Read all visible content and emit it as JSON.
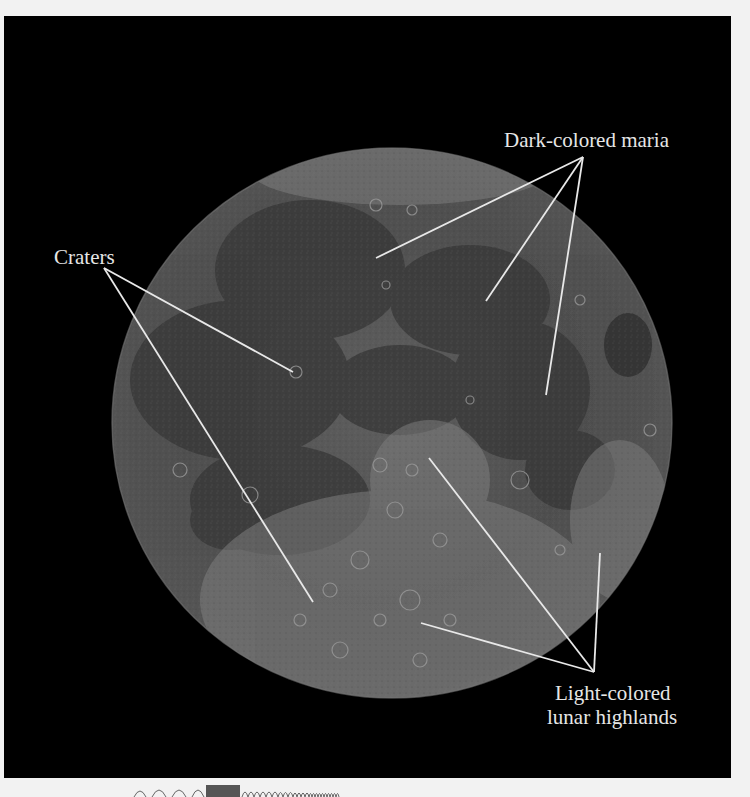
{
  "figure": {
    "background_color": "#000000",
    "page_color": "#f2f2f2",
    "label_color": "#e6e6e6",
    "leader_line_color": "#e8e8e8"
  },
  "labels": {
    "maria": "Dark-colored maria",
    "craters": "Craters",
    "highlands_line1": "Light-colored",
    "highlands_line2": "lunar highlands"
  },
  "annotations": [
    {
      "label": "Dark-colored maria",
      "anchor": [
        583,
        157
      ],
      "targets": [
        [
          376,
          258
        ],
        [
          486,
          301
        ],
        [
          546,
          395
        ]
      ]
    },
    {
      "label": "Craters",
      "anchor": [
        104,
        268
      ],
      "targets": [
        [
          293,
          372
        ],
        [
          313,
          602
        ]
      ]
    },
    {
      "label": "Light-colored lunar highlands",
      "anchor": [
        594,
        672
      ],
      "targets": [
        [
          429,
          458
        ],
        [
          421,
          623
        ],
        [
          600,
          553
        ]
      ]
    }
  ],
  "footer_graphic": "wave-spectrum-strip"
}
